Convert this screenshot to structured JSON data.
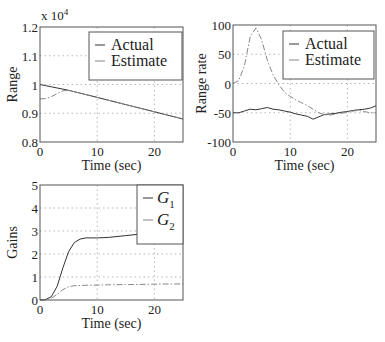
{
  "chart_data": [
    {
      "type": "line",
      "title": "",
      "xlabel": "Time (sec)",
      "ylabel": "Range",
      "y_multiplier_label": "x 10",
      "y_multiplier_exp": "4",
      "xlim": [
        0,
        25
      ],
      "ylim": [
        0.8,
        1.2
      ],
      "xticks": [
        "0",
        "10",
        "20"
      ],
      "yticks": [
        "0.8",
        "0.9",
        "1",
        "1.1",
        "1.2"
      ],
      "grid": true,
      "legend_position": "upper right",
      "legend": [
        "Actual",
        "Estimate"
      ],
      "x": [
        0,
        1,
        2,
        3,
        4,
        5,
        10,
        15,
        20,
        25
      ],
      "series": [
        {
          "name": "Actual",
          "values": [
            1.0,
            0.996,
            0.992,
            0.988,
            0.984,
            0.98,
            0.955,
            0.93,
            0.905,
            0.88
          ]
        },
        {
          "name": "Estimate",
          "values": [
            0.95,
            0.951,
            0.958,
            0.968,
            0.978,
            0.98,
            0.955,
            0.93,
            0.905,
            0.88
          ]
        }
      ]
    },
    {
      "type": "line",
      "title": "",
      "xlabel": "Time (sec)",
      "ylabel": "Range rate",
      "xlim": [
        0,
        25
      ],
      "ylim": [
        -100,
        100
      ],
      "xticks": [
        "0",
        "10",
        "20"
      ],
      "yticks": [
        "-100",
        "-50",
        "0",
        "50",
        "100"
      ],
      "grid": true,
      "legend_position": "upper right",
      "legend": [
        "Actual",
        "Estimate"
      ],
      "x": [
        0,
        1,
        2,
        3,
        4,
        5,
        6,
        7,
        8,
        9,
        10,
        11,
        12,
        13,
        14,
        15,
        16,
        17,
        18,
        19,
        20,
        21,
        22,
        23,
        24,
        25
      ],
      "series": [
        {
          "name": "Actual",
          "values": [
            -50,
            -50,
            -47,
            -44,
            -45,
            -43,
            -41,
            -44,
            -45,
            -47,
            -49,
            -52,
            -54,
            -56,
            -61,
            -57,
            -53,
            -52,
            -51,
            -49,
            -48,
            -46,
            -45,
            -44,
            -42,
            -38
          ]
        },
        {
          "name": "Estimate",
          "values": [
            0,
            5,
            30,
            80,
            95,
            75,
            40,
            15,
            -2,
            -15,
            -22,
            -28,
            -33,
            -38,
            -44,
            -50,
            -53,
            -54,
            -52,
            -51,
            -49,
            -47,
            -46,
            -48,
            -50,
            -50
          ]
        }
      ]
    },
    {
      "type": "line",
      "title": "",
      "xlabel": "Time (sec)",
      "ylabel": "Gains",
      "xlim": [
        0,
        25
      ],
      "ylim": [
        0,
        5
      ],
      "xticks": [
        "0",
        "10",
        "20"
      ],
      "yticks": [
        "0",
        "1",
        "2",
        "3",
        "4",
        "5"
      ],
      "grid": true,
      "legend_position": "upper right",
      "legend": [
        "G1",
        "G2"
      ],
      "x": [
        0,
        1,
        2,
        3,
        4,
        5,
        6,
        7,
        8,
        10,
        12,
        15,
        18,
        20,
        25
      ],
      "series": [
        {
          "name": "G1",
          "values": [
            0,
            0.02,
            0.15,
            0.6,
            1.4,
            2.1,
            2.5,
            2.65,
            2.7,
            2.7,
            2.72,
            2.8,
            2.88,
            2.9,
            2.95
          ]
        },
        {
          "name": "G2",
          "values": [
            0,
            0.01,
            0.08,
            0.25,
            0.45,
            0.58,
            0.62,
            0.63,
            0.64,
            0.65,
            0.66,
            0.67,
            0.68,
            0.69,
            0.7
          ]
        }
      ]
    }
  ]
}
